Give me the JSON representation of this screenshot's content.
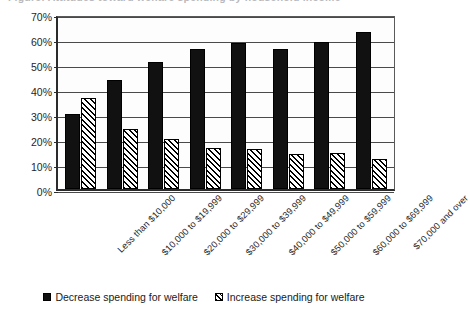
{
  "chart_data": {
    "type": "bar",
    "title": "",
    "xlabel": "",
    "ylabel": "",
    "ylim": [
      0,
      70
    ],
    "ytick_step": 10,
    "ytick_labels": [
      "0%",
      "10%",
      "20%",
      "30%",
      "40%",
      "50%",
      "60%",
      "70%"
    ],
    "grid": true,
    "legend_position": "bottom",
    "categories": [
      "Less than $10,000",
      "$10,000 to $19,999",
      "$20,000 to $29,999",
      "$30,000 to $39,999",
      "$40,000 to $49,999",
      "$50,000 to $59,999",
      "$60,000 to $69,999",
      "$70,000 and over"
    ],
    "series": [
      {
        "name": "Decrease spending for welfare",
        "fill": "solid-black",
        "color": "#111111",
        "values": [
          30,
          43.5,
          51,
          56,
          58.5,
          56,
          59,
          63
        ]
      },
      {
        "name": "Increase spending for welfare",
        "fill": "diagonal-hatch",
        "color": "#ffffff",
        "values": [
          36.5,
          24,
          20,
          16.5,
          16,
          14,
          14.5,
          12
        ]
      }
    ]
  },
  "title_sliver": {
    "text": "Figure: Attitudes toward welfare spending by household income"
  },
  "legend": {
    "items": [
      {
        "label": "Decrease spending for welfare",
        "swatch": "dark"
      },
      {
        "label": "Increase spending for welfare",
        "swatch": "hatch"
      }
    ]
  }
}
